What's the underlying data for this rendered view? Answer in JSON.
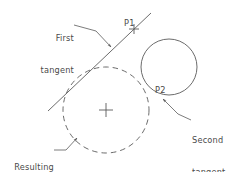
{
  "figure": {
    "background_color": "#ffffff",
    "stroke_color": "#5a5a5a",
    "text_color": "#4a4a4a",
    "labels": {
      "first_tangent_line1": "First",
      "first_tangent_line2": "tangent",
      "second_tangent_line1": "Second",
      "second_tangent_line2": "tangent",
      "resulting_circle_line1": "Resulting",
      "resulting_circle_line2": "circle",
      "point_1": "P1",
      "point_2": "P2"
    },
    "geometry": {
      "resulting_circle": {
        "style": "dashed",
        "center_x": 106,
        "center_y": 110,
        "radius": 43,
        "center_marker": "cross"
      },
      "second_circle": {
        "style": "solid",
        "center_x": 169,
        "center_y": 67,
        "radius": 28
      },
      "first_tangent": {
        "style": "solid",
        "x1": 48,
        "y1": 111,
        "x2": 151,
        "y2": 13,
        "point_marker": "cross",
        "point_marker_x": 134,
        "point_marker_y": 29
      }
    },
    "leaders": [
      {
        "name": "first-tangent-leader",
        "from_x": 74,
        "from_y": 25,
        "to_x": 111,
        "to_y": 47,
        "arrow": true
      },
      {
        "name": "second-tangent-leader",
        "from_x": 191,
        "from_y": 120,
        "to_x": 163,
        "to_y": 99,
        "arrow": true
      },
      {
        "name": "resulting-circle-leader",
        "from_x": 54,
        "from_y": 150,
        "to_x": 77,
        "to_y": 138,
        "arrow": true
      }
    ]
  }
}
